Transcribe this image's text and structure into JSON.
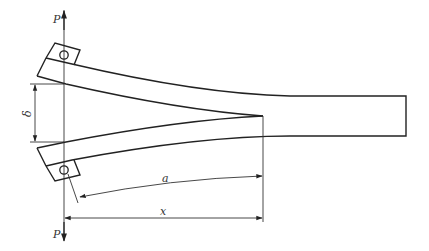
{
  "diagram": {
    "type": "double-cantilever-beam-specimen",
    "labels": {
      "load_top": "P",
      "load_bottom": "P",
      "opening_displacement": "δ",
      "crack_length": "a",
      "load_line_distance": "x"
    },
    "colors": {
      "line": "#222222",
      "background": "#ffffff"
    }
  }
}
